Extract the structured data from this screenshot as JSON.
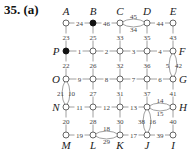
{
  "title": "35. (a)",
  "grid": {
    "cols": [
      66,
      93,
      120,
      147,
      173
    ],
    "rows": [
      23,
      51,
      79,
      107,
      135
    ]
  },
  "nodes": [
    {
      "id": "A",
      "label": "A",
      "col": 0,
      "row": 0,
      "filled": false,
      "lx": 0,
      "ly": -8
    },
    {
      "id": "B",
      "label": "B",
      "col": 1,
      "row": 0,
      "filled": true,
      "lx": 0,
      "ly": -8
    },
    {
      "id": "C",
      "label": "C",
      "col": 2,
      "row": 0,
      "filled": false,
      "lx": 0,
      "ly": -8
    },
    {
      "id": "D",
      "label": "D",
      "col": 3,
      "row": 0,
      "filled": false,
      "lx": 0,
      "ly": -8
    },
    {
      "id": "E",
      "label": "E",
      "col": 4,
      "row": 0,
      "filled": false,
      "lx": 0,
      "ly": -8
    },
    {
      "id": "P",
      "label": "P",
      "col": 0,
      "row": 1,
      "filled": true,
      "lx": -10,
      "ly": 4
    },
    {
      "id": "r1c1",
      "label": "",
      "col": 1,
      "row": 1,
      "filled": false
    },
    {
      "id": "r1c2",
      "label": "",
      "col": 2,
      "row": 1,
      "filled": false
    },
    {
      "id": "r1c3",
      "label": "",
      "col": 3,
      "row": 1,
      "filled": false
    },
    {
      "id": "F",
      "label": "F",
      "col": 4,
      "row": 1,
      "filled": false,
      "lx": 9,
      "ly": 4
    },
    {
      "id": "O",
      "label": "O",
      "col": 0,
      "row": 2,
      "filled": false,
      "lx": -10,
      "ly": 4
    },
    {
      "id": "r2c1",
      "label": "",
      "col": 1,
      "row": 2,
      "filled": false
    },
    {
      "id": "r2c2",
      "label": "",
      "col": 2,
      "row": 2,
      "filled": false
    },
    {
      "id": "r2c3",
      "label": "",
      "col": 3,
      "row": 2,
      "filled": false
    },
    {
      "id": "G",
      "label": "G",
      "col": 4,
      "row": 2,
      "filled": false,
      "lx": 10,
      "ly": 4
    },
    {
      "id": "N",
      "label": "N",
      "col": 0,
      "row": 3,
      "filled": false,
      "lx": -10,
      "ly": 4
    },
    {
      "id": "r3c1",
      "label": "",
      "col": 1,
      "row": 3,
      "filled": false
    },
    {
      "id": "r3c2",
      "label": "",
      "col": 2,
      "row": 3,
      "filled": false
    },
    {
      "id": "r3c3",
      "label": "",
      "col": 3,
      "row": 3,
      "filled": false
    },
    {
      "id": "H",
      "label": "H",
      "col": 4,
      "row": 3,
      "filled": false,
      "lx": 10,
      "ly": 4
    },
    {
      "id": "M",
      "label": "M",
      "col": 0,
      "row": 4,
      "filled": false,
      "lx": 0,
      "ly": 14
    },
    {
      "id": "L",
      "label": "L",
      "col": 1,
      "row": 4,
      "filled": false,
      "lx": 0,
      "ly": 14
    },
    {
      "id": "K",
      "label": "K",
      "col": 2,
      "row": 4,
      "filled": false,
      "lx": 0,
      "ly": 14
    },
    {
      "id": "J",
      "label": "J",
      "col": 3,
      "row": 4,
      "filled": false,
      "lx": 0,
      "ly": 14
    },
    {
      "id": "I",
      "label": "I",
      "col": 4,
      "row": 4,
      "filled": false,
      "lx": 0,
      "ly": 14
    }
  ],
  "edges": [
    {
      "from": [
        0,
        0
      ],
      "to": [
        1,
        0
      ],
      "w": "24"
    },
    {
      "from": [
        1,
        0
      ],
      "to": [
        2,
        0
      ],
      "w": "46"
    },
    {
      "from": [
        2,
        0
      ],
      "to": [
        3,
        0
      ],
      "w": "45",
      "curve": -5
    },
    {
      "from": [
        2,
        0
      ],
      "to": [
        3,
        0
      ],
      "w": "34",
      "curve": 5
    },
    {
      "from": [
        3,
        0
      ],
      "to": [
        4,
        0
      ],
      "w": "44"
    },
    {
      "from": [
        0,
        0
      ],
      "to": [
        0,
        1
      ],
      "w": "23"
    },
    {
      "from": [
        1,
        0
      ],
      "to": [
        1,
        1
      ],
      "w": "25"
    },
    {
      "from": [
        2,
        0
      ],
      "to": [
        2,
        1
      ],
      "w": "33"
    },
    {
      "from": [
        3,
        0
      ],
      "to": [
        3,
        1
      ],
      "w": "35"
    },
    {
      "from": [
        4,
        0
      ],
      "to": [
        4,
        1
      ],
      "w": "43"
    },
    {
      "from": [
        0,
        1
      ],
      "to": [
        1,
        1
      ],
      "w": "1"
    },
    {
      "from": [
        1,
        1
      ],
      "to": [
        2,
        1
      ],
      "w": "2"
    },
    {
      "from": [
        2,
        1
      ],
      "to": [
        3,
        1
      ],
      "w": "3"
    },
    {
      "from": [
        3,
        1
      ],
      "to": [
        4,
        1
      ],
      "w": "4"
    },
    {
      "from": [
        0,
        1
      ],
      "to": [
        0,
        2
      ],
      "w": "22"
    },
    {
      "from": [
        1,
        1
      ],
      "to": [
        1,
        2
      ],
      "w": "26"
    },
    {
      "from": [
        2,
        1
      ],
      "to": [
        2,
        2
      ],
      "w": "32"
    },
    {
      "from": [
        3,
        1
      ],
      "to": [
        3,
        2
      ],
      "w": "36"
    },
    {
      "from": [
        4,
        1
      ],
      "to": [
        4,
        2
      ],
      "w": "5",
      "curve": -5
    },
    {
      "from": [
        4,
        1
      ],
      "to": [
        4,
        2
      ],
      "w": "42",
      "curve": 5
    },
    {
      "from": [
        0,
        2
      ],
      "to": [
        1,
        2
      ],
      "w": "9"
    },
    {
      "from": [
        1,
        2
      ],
      "to": [
        2,
        2
      ],
      "w": "8"
    },
    {
      "from": [
        2,
        2
      ],
      "to": [
        3,
        2
      ],
      "w": "7"
    },
    {
      "from": [
        3,
        2
      ],
      "to": [
        4,
        2
      ],
      "w": "6"
    },
    {
      "from": [
        0,
        2
      ],
      "to": [
        0,
        3
      ],
      "w": "21",
      "curve": -5
    },
    {
      "from": [
        0,
        2
      ],
      "to": [
        0,
        3
      ],
      "w": "10",
      "curve": 5
    },
    {
      "from": [
        1,
        2
      ],
      "to": [
        1,
        3
      ],
      "w": "27"
    },
    {
      "from": [
        2,
        2
      ],
      "to": [
        2,
        3
      ],
      "w": "31"
    },
    {
      "from": [
        3,
        2
      ],
      "to": [
        3,
        3
      ],
      "w": "37"
    },
    {
      "from": [
        4,
        2
      ],
      "to": [
        4,
        3
      ],
      "w": "41"
    },
    {
      "from": [
        0,
        3
      ],
      "to": [
        1,
        3
      ],
      "w": "11"
    },
    {
      "from": [
        1,
        3
      ],
      "to": [
        2,
        3
      ],
      "w": "12"
    },
    {
      "from": [
        2,
        3
      ],
      "to": [
        3,
        3
      ],
      "w": "13"
    },
    {
      "from": [
        3,
        3
      ],
      "to": [
        4,
        3
      ],
      "w": "14",
      "curve": -5
    },
    {
      "from": [
        3,
        3
      ],
      "to": [
        4,
        3
      ],
      "w": "15",
      "curve": 5
    },
    {
      "from": [
        0,
        3
      ],
      "to": [
        0,
        4
      ],
      "w": "20"
    },
    {
      "from": [
        1,
        3
      ],
      "to": [
        1,
        4
      ],
      "w": "28"
    },
    {
      "from": [
        2,
        3
      ],
      "to": [
        2,
        4
      ],
      "w": "30"
    },
    {
      "from": [
        3,
        3
      ],
      "to": [
        3,
        4
      ],
      "w": "38",
      "curve": -5
    },
    {
      "from": [
        3,
        3
      ],
      "to": [
        3,
        4
      ],
      "w": "16",
      "curve": 5
    },
    {
      "from": [
        4,
        3
      ],
      "to": [
        4,
        4
      ],
      "w": "40"
    },
    {
      "from": [
        0,
        4
      ],
      "to": [
        1,
        4
      ],
      "w": "19"
    },
    {
      "from": [
        1,
        4
      ],
      "to": [
        2,
        4
      ],
      "w": "18",
      "curve": -5
    },
    {
      "from": [
        1,
        4
      ],
      "to": [
        2,
        4
      ],
      "w": "29",
      "curve": 5
    },
    {
      "from": [
        2,
        4
      ],
      "to": [
        3,
        4
      ],
      "w": "17"
    },
    {
      "from": [
        3,
        4
      ],
      "to": [
        4,
        4
      ],
      "w": "39"
    }
  ]
}
